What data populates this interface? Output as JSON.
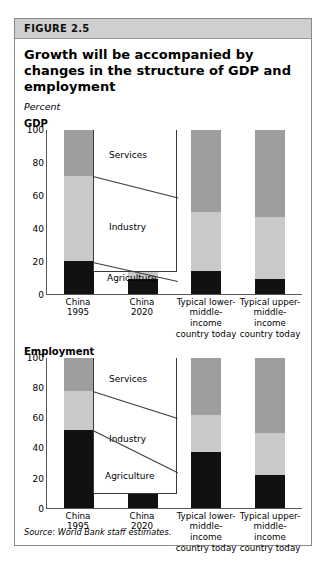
{
  "figure": {
    "band_label": "FIGURE 2.5",
    "title": "Growth will be accompanied by changes in the structure of GDP and employment",
    "subtitle": "Percent",
    "source": "Source: World Bank staff estimates."
  },
  "colors": {
    "services": "#9e9e9e",
    "industry": "#c9c9c9",
    "agriculture": "#111111",
    "band": "#cfcfcf",
    "frame": "#8a8a8a",
    "axis": "#555555"
  },
  "panels": [
    {
      "label": "GDP",
      "callouts": {
        "services": "Services",
        "industry": "Industry",
        "agriculture": "Agriculture"
      }
    },
    {
      "label": "Employment",
      "callouts": {
        "services": "Services",
        "industry": "Industry",
        "agriculture": "Agriculture"
      }
    }
  ],
  "chart_data": [
    {
      "type": "bar",
      "stacked": true,
      "title": "GDP",
      "xlabel": "",
      "ylabel": "Percent",
      "ylim": [
        0,
        100
      ],
      "yticks": [
        0,
        20,
        40,
        60,
        80,
        100
      ],
      "grid": false,
      "legend": [
        "Services",
        "Industry",
        "Agriculture"
      ],
      "legend_position": "inline-callout",
      "categories": [
        "China 1995",
        "China 2020",
        "Typical lower-middle-income country today",
        "Typical upper-middle-income country today"
      ],
      "series": [
        {
          "name": "Agriculture",
          "values": [
            20,
            9,
            14,
            9
          ]
        },
        {
          "name": "Industry",
          "values": [
            52,
            50,
            36,
            38
          ]
        },
        {
          "name": "Services",
          "values": [
            28,
            41,
            50,
            53
          ]
        }
      ]
    },
    {
      "type": "bar",
      "stacked": true,
      "title": "Employment",
      "xlabel": "",
      "ylabel": "Percent",
      "ylim": [
        0,
        100
      ],
      "yticks": [
        0,
        20,
        40,
        60,
        80,
        100
      ],
      "grid": false,
      "legend": [
        "Services",
        "Industry",
        "Agriculture"
      ],
      "legend_position": "inline-callout",
      "categories": [
        "China 1995",
        "China 2020",
        "Typical lower-middle-income country today",
        "Typical upper-middle-income country today"
      ],
      "series": [
        {
          "name": "Agriculture",
          "values": [
            52,
            24,
            37,
            22
          ]
        },
        {
          "name": "Industry",
          "values": [
            26,
            36,
            25,
            28
          ]
        },
        {
          "name": "Services",
          "values": [
            22,
            40,
            38,
            50
          ]
        }
      ]
    }
  ],
  "xtick_lines": [
    [
      "China",
      "1995"
    ],
    [
      "China",
      "2020"
    ],
    [
      "Typical lower-",
      "middle-income",
      "country today"
    ],
    [
      "Typical upper-",
      "middle-income",
      "country today"
    ]
  ]
}
